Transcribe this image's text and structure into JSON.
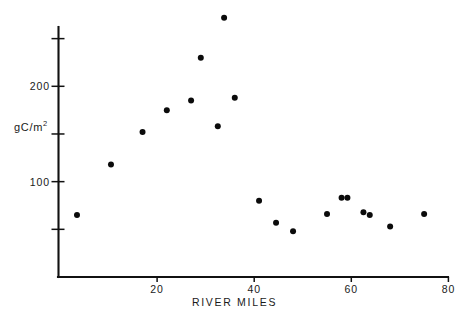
{
  "chart_data": {
    "type": "scatter",
    "title": "",
    "subtitle": "",
    "xlabel": "RIVER MILES",
    "ylabel": "gC/m2",
    "ylabel_html": "gC/m<sup>2</sup>",
    "xlim": [
      0,
      80
    ],
    "ylim": [
      0,
      290
    ],
    "grid": false,
    "legend": null,
    "legend_position": "none",
    "marker_color": "#0b0b0b",
    "marker_shape": "circle",
    "marker_size": 6,
    "axis_color": "#111111",
    "background_color": "#ffffff",
    "x_ticks": [
      {
        "value": 20,
        "label": "20"
      },
      {
        "value": 40,
        "label": "40"
      },
      {
        "value": 60,
        "label": "60"
      },
      {
        "value": 80,
        "label": "80"
      }
    ],
    "y_ticks": [
      {
        "value": 250,
        "label": ""
      },
      {
        "value": 200,
        "label": "200"
      },
      {
        "value": 150,
        "label": ""
      },
      {
        "value": 100,
        "label": "100"
      },
      {
        "value": 50,
        "label": ""
      }
    ],
    "points": [
      {
        "x": 3.5,
        "y": 65
      },
      {
        "x": 10.5,
        "y": 118
      },
      {
        "x": 17.0,
        "y": 152
      },
      {
        "x": 22.0,
        "y": 175
      },
      {
        "x": 27.0,
        "y": 185
      },
      {
        "x": 29.0,
        "y": 230
      },
      {
        "x": 32.5,
        "y": 158
      },
      {
        "x": 33.8,
        "y": 272
      },
      {
        "x": 36.0,
        "y": 188
      },
      {
        "x": 41.0,
        "y": 80
      },
      {
        "x": 44.5,
        "y": 57
      },
      {
        "x": 48.0,
        "y": 48
      },
      {
        "x": 55.0,
        "y": 66
      },
      {
        "x": 58.0,
        "y": 83
      },
      {
        "x": 59.2,
        "y": 83
      },
      {
        "x": 62.5,
        "y": 68
      },
      {
        "x": 63.8,
        "y": 65
      },
      {
        "x": 68.0,
        "y": 53
      },
      {
        "x": 75.0,
        "y": 66
      }
    ]
  }
}
